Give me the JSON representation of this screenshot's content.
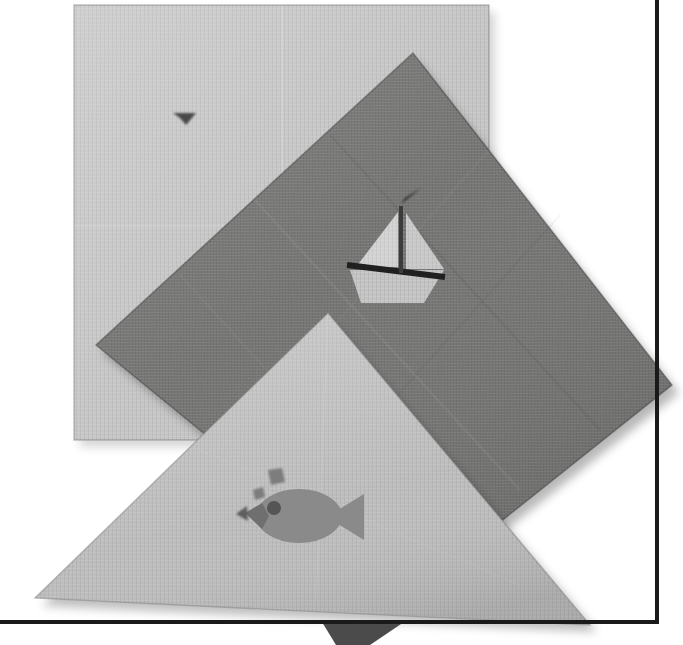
{
  "scene": {
    "title": "Paper napkin composition photograph",
    "description": "Three overlapping paper napkins on a white surface inside a thin black picture frame",
    "canvas": {
      "width": 683,
      "height": 645
    },
    "background_color": "#ffffff"
  },
  "frame": {
    "name": "picture-frame",
    "color": "#1a1a1a",
    "vertical_line": {
      "x": 657,
      "y_start": 0,
      "y_end": 622,
      "thickness": 4
    },
    "horizontal_line": {
      "y": 622,
      "x_start": 0,
      "x_end": 659,
      "thickness": 4
    }
  },
  "napkins": [
    {
      "id": "square-napkin",
      "label": "Light gray square napkin",
      "shape": "square",
      "color": "#c6c6c6",
      "edge_color": "#b4b4b4",
      "points": "74,5 489,5 489,440 74,440",
      "rotation_deg": 0
    },
    {
      "id": "diamond-napkin",
      "label": "Dark gray diamond napkin",
      "shape": "square rotated 45 degrees",
      "color": "#70706f",
      "edge_color": "#5e5e5d",
      "points": "413,53 672,385 405,598 96,345",
      "rotation_deg": 45
    },
    {
      "id": "triangle-napkin",
      "label": "Light gray triangular folded napkin",
      "shape": "triangle",
      "color": "#bdbdbd",
      "edge_color": "#aaaaaa",
      "points": "328,313 590,625 35,598",
      "rotation_deg": 0
    }
  ],
  "motifs": [
    {
      "id": "sailboat-motif",
      "label": "Sailboat printed on the dark diamond napkin",
      "on_napkin": "diamond-napkin",
      "parts": {
        "hull": {
          "points": "352,270 442,270 424,302 362,302",
          "color": "#c3c3c3"
        },
        "deck_line": {
          "points": "348,264 444,276",
          "color": "#232323",
          "thickness": 6
        },
        "mast": {
          "points": "401,208 401,272",
          "color": "#3a3a3a",
          "thickness": 4
        },
        "sail_front": {
          "points": "397,210 355,266 397,266",
          "color": "#cfcfcf"
        },
        "sail_back": {
          "points": "405,211 443,268 405,268",
          "color": "#c9c9c9"
        },
        "pennant": {
          "points": "401,203 418,190 404,196",
          "color": "#2e2e2e"
        }
      }
    },
    {
      "id": "fish-motif",
      "label": "Fish with bubbles printed on the triangular napkin",
      "on_napkin": "triangle-napkin",
      "color": "#8b8b8b",
      "parts": {
        "body": {
          "cx": 299,
          "cy": 516,
          "rx": 42,
          "ry": 26,
          "color": "#8a8a8a"
        },
        "tail": {
          "points": "340,512 362,496 362,538 340,522",
          "color": "#8a8a8a"
        },
        "mouth": {
          "points": "259,506 246,514 259,527",
          "color": "#6d6d6d"
        },
        "eye": {
          "cx": 273,
          "cy": 508,
          "r": 6,
          "color": "#5a5a5a"
        },
        "bubbles": [
          {
            "cx": 258,
            "cy": 494,
            "r": 5,
            "color": "#7c7c7c"
          },
          {
            "cx": 273,
            "cy": 477,
            "r": 7,
            "color": "#7c7c7c"
          }
        ]
      }
    },
    {
      "id": "bird-motif",
      "label": "Small dark bird silhouette on the square napkin",
      "on_napkin": "square-napkin",
      "color": "#4a4a4a",
      "points": "173,113 196,113 186,125 180,118"
    },
    {
      "id": "shadow-wedge",
      "label": "Dark wedge shadow below the frame edge",
      "color": "#4b4b4b",
      "points": "322,622 404,622 370,645 336,645"
    }
  ],
  "palette": {
    "white": "#ffffff",
    "light_gray": "#c6c6c6",
    "mid_light_gray": "#bdbdbd",
    "dark_gray": "#70706f",
    "motif_gray": "#8a8a8a",
    "frame_black": "#1a1a1a"
  }
}
